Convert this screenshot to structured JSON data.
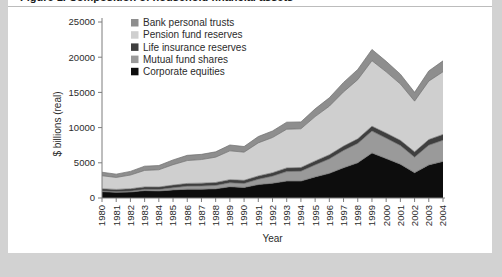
{
  "page": {
    "background_color": "#d2d2d2",
    "card_color": "#ffffff",
    "clipped_header_text": "Figure 1. Composition of household financial assets"
  },
  "chart_data": {
    "type": "area",
    "stacked": true,
    "title": "",
    "xlabel": "Year",
    "ylabel": "$ billions (real)",
    "xlim": [
      1980,
      2004
    ],
    "ylim": [
      0,
      25000
    ],
    "ytick_labels": [
      "0",
      "5000",
      "10000",
      "15000",
      "20000",
      "25000"
    ],
    "yticks": [
      0,
      5000,
      10000,
      15000,
      20000,
      25000
    ],
    "grid": false,
    "legend_position": "top-left-inside",
    "categories": [
      "1980",
      "1981",
      "1982",
      "1983",
      "1984",
      "1985",
      "1986",
      "1987",
      "1988",
      "1989",
      "1990",
      "1991",
      "1992",
      "1993",
      "1994",
      "1995",
      "1996",
      "1997",
      "1998",
      "1999",
      "2000",
      "2001",
      "2002",
      "2003",
      "2004"
    ],
    "series": [
      {
        "name": "Corporate equities",
        "color": "#0d0d0d",
        "values": [
          900,
          800,
          850,
          1050,
          1000,
          1150,
          1250,
          1250,
          1300,
          1600,
          1500,
          1900,
          2100,
          2400,
          2400,
          3000,
          3500,
          4300,
          5000,
          6400,
          5600,
          4800,
          3600,
          4700,
          5200
        ]
      },
      {
        "name": "Mutual fund shares",
        "color": "#9a9a9a",
        "values": [
          80,
          90,
          120,
          170,
          200,
          300,
          420,
          450,
          480,
          560,
          560,
          760,
          1000,
          1350,
          1400,
          1700,
          2050,
          2450,
          2750,
          3100,
          2900,
          2650,
          2200,
          2800,
          3000
        ]
      },
      {
        "name": "Life insurance reserves",
        "color": "#3f3f3f",
        "values": [
          330,
          330,
          340,
          350,
          360,
          380,
          400,
          410,
          420,
          440,
          450,
          470,
          490,
          520,
          530,
          560,
          590,
          620,
          660,
          700,
          720,
          740,
          760,
          800,
          830
        ]
      },
      {
        "name": "Pension fund reserves",
        "color": "#cfcfcf",
        "values": [
          1850,
          1700,
          1950,
          2350,
          2450,
          2900,
          3250,
          3350,
          3600,
          4100,
          4000,
          4700,
          5000,
          5500,
          5500,
          6300,
          6900,
          7700,
          8400,
          9300,
          8700,
          8000,
          7200,
          8300,
          8900
        ]
      },
      {
        "name": "Bank personal trusts",
        "color": "#8e8e8e",
        "values": [
          500,
          470,
          520,
          600,
          600,
          680,
          740,
          740,
          760,
          830,
          800,
          900,
          930,
          1000,
          980,
          1100,
          1200,
          1350,
          1450,
          1600,
          1500,
          1400,
          1250,
          1450,
          1550
        ]
      }
    ],
    "legend_order_top_to_bottom": [
      "Bank personal trusts",
      "Pension fund reserves",
      "Life insurance reserves",
      "Mutual fund shares",
      "Corporate equities"
    ]
  }
}
